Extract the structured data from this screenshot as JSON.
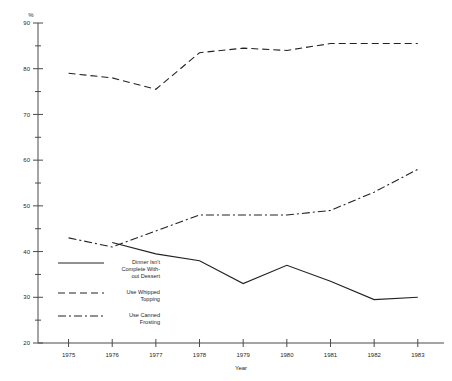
{
  "chart_data": {
    "type": "line",
    "title": "",
    "subtitle": "",
    "xlabel": "Year",
    "ylabel": "%",
    "unit_label": "%",
    "x": [
      1975,
      1976,
      1977,
      1978,
      1979,
      1980,
      1981,
      1982,
      1983
    ],
    "xticklabels": [
      "1975",
      "1976",
      "1977",
      "1978",
      "1979",
      "1980",
      "1981",
      "1982",
      "1983"
    ],
    "xlim": [
      1974.3,
      1983.6
    ],
    "ylim": [
      20,
      90
    ],
    "yticks": [
      20,
      30,
      40,
      50,
      60,
      70,
      80,
      90
    ],
    "yticklabels": [
      "20",
      "30",
      "40",
      "50",
      "60",
      "70",
      "80",
      "90"
    ],
    "yminorticks": [
      25,
      35,
      45,
      55,
      65,
      75,
      85
    ],
    "grid": false,
    "legend_position": "inside-lower-left",
    "series": [
      {
        "name": "Dinner Isn't Complete With-out Dessert",
        "legend_lines": [
          "Dinner Isn't",
          "Complete With-",
          "out Dessert"
        ],
        "style": "solid",
        "x": [
          1976,
          1977,
          1978,
          1979,
          1980,
          1981,
          1982,
          1983
        ],
        "values": [
          42.0,
          39.5,
          38.0,
          33.0,
          37.0,
          33.5,
          29.5,
          30.0
        ]
      },
      {
        "name": "Use Whipped Topping",
        "legend_lines": [
          "Use Whipped",
          "Topping"
        ],
        "style": "dashed",
        "x": [
          1975,
          1976,
          1977,
          1978,
          1979,
          1980,
          1981,
          1982,
          1983
        ],
        "values": [
          79.0,
          78.0,
          75.5,
          83.5,
          84.5,
          84.0,
          85.5,
          85.5,
          85.5
        ]
      },
      {
        "name": "Use Canned Frosting",
        "legend_lines": [
          "Use Canned",
          "Frosting"
        ],
        "style": "dash-dot",
        "x": [
          1975,
          1976,
          1977,
          1978,
          1979,
          1980,
          1981,
          1982,
          1983
        ],
        "values": [
          43.0,
          41.0,
          44.5,
          48.0,
          48.0,
          48.0,
          49.0,
          53.0,
          58.0
        ]
      }
    ],
    "colors": {
      "line": "#222222",
      "axis": "#4a4a4a",
      "text": "#1f1f1f",
      "background": "#ffffff"
    }
  }
}
